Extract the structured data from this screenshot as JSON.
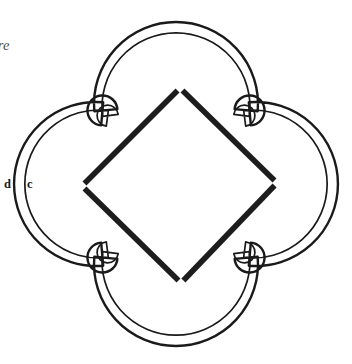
{
  "figure": {
    "canvas": {
      "width": 352,
      "height": 364,
      "background": "#ffffff"
    },
    "center": {
      "x": 176,
      "y": 184
    },
    "outline": {
      "kind": "quatrefoil-double-contour",
      "stroke_color": "#1a1a1a",
      "outer_stroke_width": 2.4,
      "inner_stroke_width": 1.7,
      "contour_gap": 8,
      "fill": "none",
      "lobe_count": 4,
      "lobe_radius": 82,
      "lobe_center_offset": 80,
      "cusp_count": 4,
      "cusp_radius": 15,
      "cusp_offset": 104,
      "extents": {
        "left": 15,
        "right": 336,
        "top": 11,
        "bottom": 357
      }
    },
    "inscribed_square": {
      "kind": "rotated-square",
      "rotation_deg": 45,
      "stroke_color": "#1d1d1d",
      "stroke_width": 5.6,
      "vertex_gap": 7,
      "vertices": [
        {
          "name": "top",
          "x": 180,
          "y": 88
        },
        {
          "name": "right",
          "x": 277,
          "y": 183
        },
        {
          "name": "bottom",
          "x": 181,
          "y": 283
        },
        {
          "name": "left",
          "x": 82,
          "y": 186
        }
      ]
    }
  },
  "labels": {
    "outer_point": "d",
    "inner_point": "c",
    "annotation": "ntre"
  }
}
